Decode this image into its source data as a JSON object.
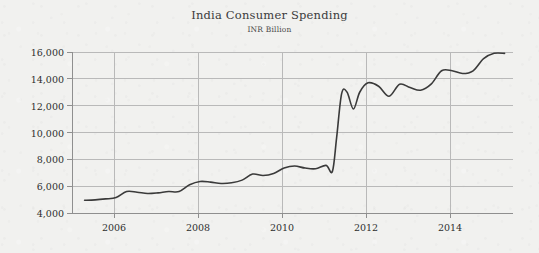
{
  "chart_data": {
    "type": "line",
    "title": "India Consumer Spending",
    "subtitle": "INR Billion",
    "xlabel": "",
    "ylabel": "",
    "ylim": [
      4000,
      16000
    ],
    "xlim": [
      2005.0,
      2015.5
    ],
    "y_ticks": [
      4000,
      6000,
      8000,
      10000,
      12000,
      14000,
      16000
    ],
    "y_tick_labels": [
      "4,000",
      "6,000",
      "8,000",
      "10,000",
      "12,000",
      "14,000",
      "16,000"
    ],
    "x_ticks": [
      2006,
      2008,
      2010,
      2012,
      2014
    ],
    "x_tick_labels": [
      "2006",
      "2008",
      "2010",
      "2012",
      "2014"
    ],
    "grid": true,
    "legend": null,
    "line_color": "#3a3a3a",
    "grid_color": "#b9b9b9",
    "axis_color": "#8f8f8f",
    "background_color": "#f1f1ef",
    "series": [
      {
        "name": "India Consumer Spending",
        "x": [
          2005.3,
          2005.55,
          2005.8,
          2006.05,
          2006.3,
          2006.55,
          2006.8,
          2007.05,
          2007.3,
          2007.55,
          2007.8,
          2008.05,
          2008.3,
          2008.55,
          2008.8,
          2009.05,
          2009.3,
          2009.55,
          2009.8,
          2010.05,
          2010.3,
          2010.55,
          2010.8,
          2011.05,
          2011.2,
          2011.3,
          2011.42,
          2011.55,
          2011.7,
          2011.85,
          2012.05,
          2012.3,
          2012.55,
          2012.8,
          2013.05,
          2013.3,
          2013.55,
          2013.8,
          2014.05,
          2014.3,
          2014.55,
          2014.8,
          2015.05,
          2015.3
        ],
        "values": [
          4950,
          4980,
          5050,
          5150,
          5600,
          5550,
          5450,
          5500,
          5600,
          5600,
          6100,
          6350,
          6300,
          6200,
          6250,
          6450,
          6900,
          6800,
          6950,
          7350,
          7500,
          7350,
          7300,
          7550,
          7100,
          9600,
          12900,
          13000,
          11750,
          13000,
          13700,
          13450,
          12700,
          13600,
          13350,
          13150,
          13600,
          14600,
          14600,
          14400,
          14600,
          15500,
          15900,
          15900
        ]
      }
    ]
  }
}
